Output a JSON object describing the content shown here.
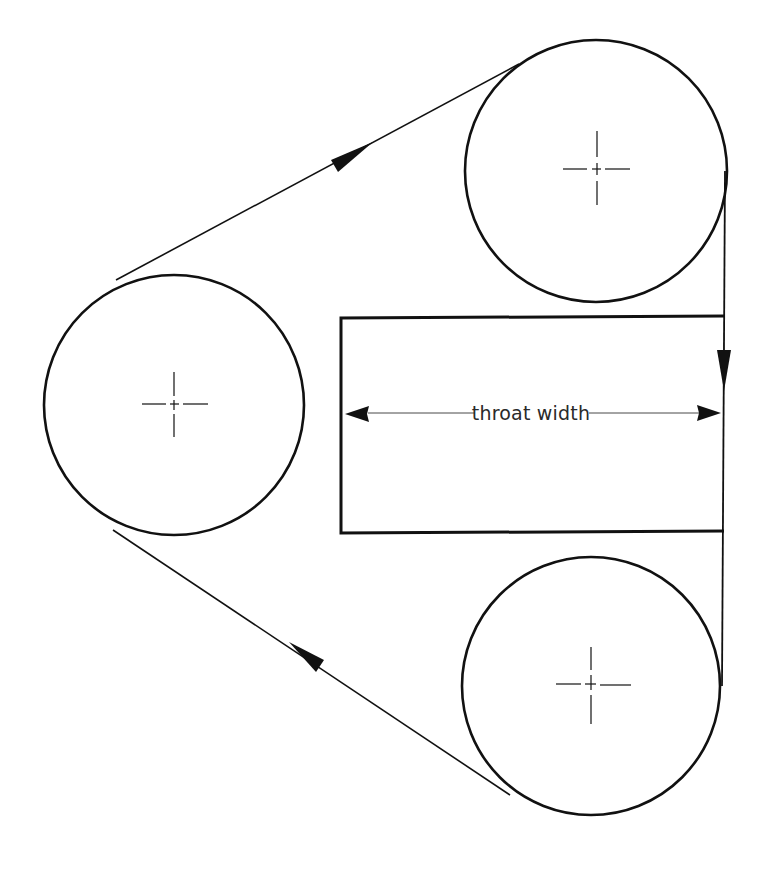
{
  "diagram": {
    "colors": {
      "background": "#ffffff",
      "stroke": "#111111",
      "label": "#2a2a2a"
    },
    "wheels": [
      {
        "id": "left-wheel",
        "cx": 174,
        "cy": 405,
        "r": 130
      },
      {
        "id": "top-right-wheel",
        "cx": 596,
        "cy": 171,
        "r": 131
      },
      {
        "id": "bottom-right-wheel",
        "cx": 591,
        "cy": 686,
        "r": 129
      }
    ],
    "frame": {
      "x_left": 341,
      "x_right": 724,
      "y_top": 317,
      "y_bottom": 533
    },
    "blade": {
      "x": 724,
      "y_start": 171,
      "y_end": 686,
      "direction": "down"
    },
    "belt_segments": [
      {
        "id": "upper-run",
        "from": [
          116,
          280
        ],
        "to": [
          519,
          64
        ],
        "arrow_direction": "up-right"
      },
      {
        "id": "lower-run",
        "from": [
          113,
          530
        ],
        "to": [
          510,
          795
        ],
        "arrow_direction": "up-left"
      }
    ],
    "dimension": {
      "label": "throat width",
      "y": 413,
      "x_start": 345,
      "x_end": 721
    }
  }
}
